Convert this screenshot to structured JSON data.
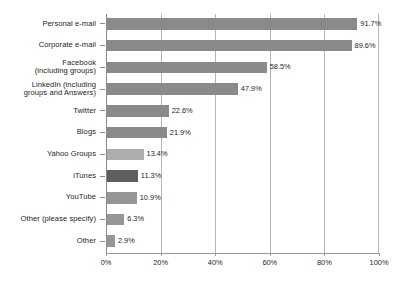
{
  "chart_data": {
    "type": "bar",
    "orientation": "horizontal",
    "title": "",
    "subtitle": "",
    "xlabel": "",
    "ylabel": "",
    "xlim": [
      0,
      100
    ],
    "xtick_labels": [
      "0%",
      "20%",
      "40%",
      "60%",
      "80%",
      "100%"
    ],
    "xtick_values": [
      0,
      20,
      40,
      60,
      80,
      100
    ],
    "grid": "vertical",
    "legend": "none",
    "value_suffix": "%",
    "categories": [
      "Personal e-mail",
      "Corporate e-mail",
      "Facebook\n(including groups)",
      "LinkedIn (including\ngroups and Answers)",
      "Twitter",
      "Blogs",
      "Yahoo Groups",
      "iTunes",
      "YouTube",
      "Other (please specify)",
      "Other"
    ],
    "values": [
      91.7,
      89.6,
      58.5,
      47.9,
      22.6,
      21.9,
      13.4,
      11.3,
      10.9,
      6.3,
      2.9
    ],
    "value_labels": [
      "91.7%",
      "89.6%",
      "58.5%",
      "47.9%",
      "22.6%",
      "21.9%",
      "13.4%",
      "11.3%",
      "10.9%",
      "6.3%",
      "2.9%"
    ],
    "bar_shades": [
      "shade-mid",
      "shade-mid",
      "shade-mid",
      "shade-mid",
      "shade-mid",
      "shade-mid",
      "shade-light",
      "shade-dark",
      "shade-med2",
      "shade-med2",
      "shade-med2"
    ],
    "colors": {
      "bar_mid": "#8a8a8a",
      "bar_light": "#adadad",
      "bar_dark": "#5f5f5f",
      "bar_med2": "#969696",
      "gridline": "#b5b5b5",
      "axis": "#9a9a9a",
      "text": "#231f20",
      "background": "#ffffff"
    }
  }
}
